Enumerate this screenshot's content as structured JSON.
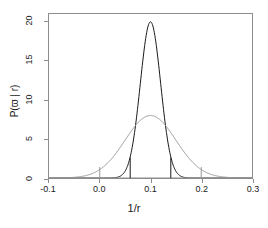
{
  "chart_data": {
    "type": "line",
    "title": "",
    "subtitle": "",
    "xlabel": "1/r",
    "ylabel": "P(ϖ | r)",
    "xlim": [
      -0.1,
      0.3
    ],
    "ylim": [
      0,
      21
    ],
    "grid": false,
    "legend": null,
    "xticks": [
      {
        "value": -0.1,
        "label": "-0.1"
      },
      {
        "value": 0.0,
        "label": "0.0"
      },
      {
        "value": 0.1,
        "label": "0.1"
      },
      {
        "value": 0.2,
        "label": "0.2"
      },
      {
        "value": 0.3,
        "label": "0.3"
      }
    ],
    "yticks": [
      {
        "value": 0,
        "label": "0"
      },
      {
        "value": 5,
        "label": "5"
      },
      {
        "value": 10,
        "label": "10"
      },
      {
        "value": 15,
        "label": "15"
      },
      {
        "value": 20,
        "label": "20"
      }
    ],
    "series": [
      {
        "name": "narrow-posterior",
        "color": "#1a1a1a",
        "kind": "gaussian",
        "mean": 0.1,
        "sigma": 0.02,
        "peak": 20.0,
        "linewidth": 1.0
      },
      {
        "name": "wide-posterior",
        "color": "#999999",
        "kind": "gaussian",
        "mean": 0.1,
        "sigma": 0.05,
        "peak": 8.0,
        "linewidth": 1.0
      }
    ],
    "interval_markers": [
      {
        "name": "wide-lower",
        "x": 0.0,
        "height": 1.4,
        "color": "#999999"
      },
      {
        "name": "narrow-lower",
        "x": 0.06,
        "height": 2.6,
        "color": "#1a1a1a"
      },
      {
        "name": "narrow-upper",
        "x": 0.14,
        "height": 2.6,
        "color": "#1a1a1a"
      },
      {
        "name": "wide-upper",
        "x": 0.2,
        "height": 1.4,
        "color": "#999999"
      }
    ],
    "axis_color": "#8c8c8c"
  }
}
